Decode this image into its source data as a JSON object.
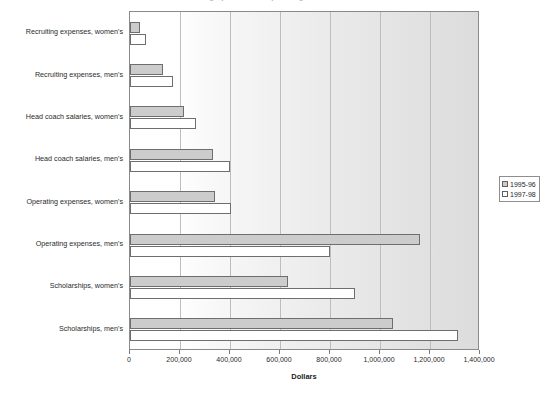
{
  "chart_data": {
    "type": "bar",
    "orientation": "horizontal",
    "title": "Average per-school spending",
    "xlabel": "Dollars",
    "ylabel": "",
    "xlim": [
      0,
      1400000
    ],
    "xticks": [
      0,
      200000,
      400000,
      600000,
      800000,
      1000000,
      1200000,
      1400000
    ],
    "xtick_labels": [
      "0",
      "200,000",
      "400,000",
      "600,000",
      "800,000",
      "1,000,000",
      "1,200,000",
      "1,400,000"
    ],
    "grid": true,
    "legend_position": "right",
    "categories": [
      "Recruiting expenses, women's",
      "Recruiting expenses, men's",
      "Head coach salaries, women's",
      "Head coach salaries, men's",
      "Operating expenses, women's",
      "Operating expenses, men's",
      "Scholarships, women's",
      "Scholarships, men's"
    ],
    "series": [
      {
        "name": "1995-96",
        "color": "#cccccc",
        "values": [
          40000,
          130000,
          215000,
          330000,
          340000,
          1160000,
          630000,
          1050000
        ]
      },
      {
        "name": "1997-98",
        "color": "#ffffff",
        "values": [
          65000,
          170000,
          265000,
          400000,
          405000,
          800000,
          900000,
          1310000
        ]
      }
    ]
  },
  "legend": {
    "items": [
      {
        "label": "1995-96",
        "swatch": "#cccccc"
      },
      {
        "label": "1997-98",
        "swatch": "#ffffff"
      }
    ]
  },
  "axis": {
    "x_title": "Dollars"
  }
}
